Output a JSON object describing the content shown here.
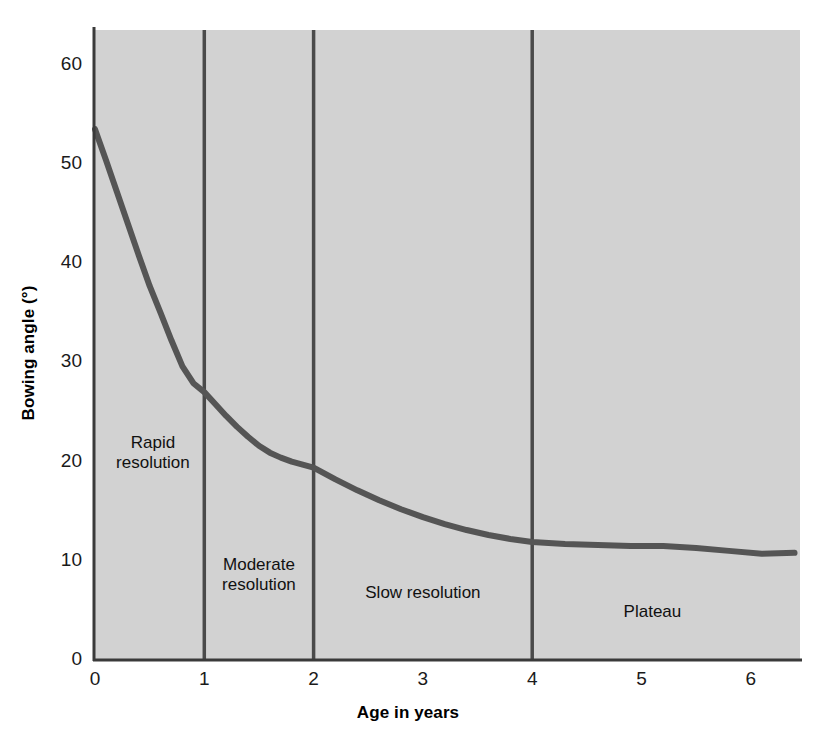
{
  "chart_data": {
    "type": "line",
    "title": "",
    "xlabel": "Age in years",
    "ylabel": "Bowing angle (°)",
    "xlim": [
      0,
      6.45
    ],
    "ylim": [
      0,
      63.5
    ],
    "xticks": [
      "0",
      "1",
      "2",
      "3",
      "4",
      "5",
      "6"
    ],
    "xtick_values": [
      0,
      1,
      2,
      3,
      4,
      5,
      6
    ],
    "yticks": [
      "0",
      "10",
      "20",
      "30",
      "40",
      "50",
      "60"
    ],
    "ytick_values": [
      0,
      10,
      20,
      30,
      40,
      50,
      60
    ],
    "grid": false,
    "legend": "none",
    "plot_background_color": "#d2d2d2",
    "line_color": "#555555",
    "divider_color": "#4a4a4a",
    "axis_color": "#333333",
    "series": [
      {
        "name": "Bowing angle",
        "x": [
          0.0,
          0.1,
          0.2,
          0.3,
          0.4,
          0.5,
          0.6,
          0.7,
          0.8,
          0.9,
          1.0,
          1.1,
          1.2,
          1.3,
          1.4,
          1.5,
          1.6,
          1.7,
          1.8,
          1.9,
          2.0,
          2.2,
          2.4,
          2.6,
          2.8,
          3.0,
          3.2,
          3.4,
          3.6,
          3.8,
          4.0,
          4.3,
          4.6,
          4.9,
          5.2,
          5.5,
          5.8,
          6.1,
          6.4
        ],
        "y": [
          53.5,
          50.4,
          47.2,
          44.0,
          40.8,
          37.7,
          35.0,
          32.2,
          29.6,
          27.9,
          27.0,
          25.8,
          24.6,
          23.5,
          22.5,
          21.6,
          20.9,
          20.4,
          20.0,
          19.7,
          19.4,
          18.2,
          17.1,
          16.1,
          15.2,
          14.4,
          13.7,
          13.1,
          12.6,
          12.2,
          11.9,
          11.7,
          11.6,
          11.5,
          11.5,
          11.3,
          11.0,
          10.7,
          10.8
        ]
      }
    ],
    "dividers": [
      {
        "name": "divider-year-1",
        "x": 1
      },
      {
        "name": "divider-year-2",
        "x": 2
      },
      {
        "name": "divider-year-4",
        "x": 4
      }
    ],
    "annotations": [
      {
        "name": "rapid-resolution",
        "text": "Rapid\nresolution",
        "x": 0.53,
        "y": 21.5
      },
      {
        "name": "moderate-resolution",
        "text": "Moderate\nresolution",
        "x": 1.5,
        "y": 9.2
      },
      {
        "name": "slow-resolution",
        "text": "Slow resolution",
        "x": 3.0,
        "y": 6.3
      },
      {
        "name": "plateau",
        "text": "Plateau",
        "x": 5.1,
        "y": 4.4
      }
    ]
  }
}
